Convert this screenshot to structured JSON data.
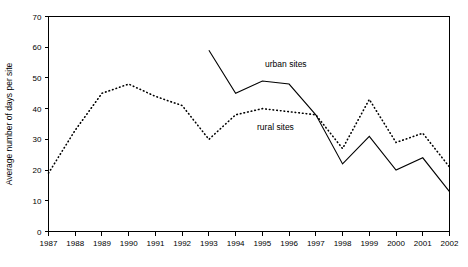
{
  "chart_data": {
    "type": "line",
    "title": "",
    "xlabel": "",
    "ylabel": "Average number of days per site",
    "categories": [
      "1987",
      "1988",
      "1989",
      "1990",
      "1991",
      "1992",
      "1993",
      "1994",
      "1995",
      "1996",
      "1997",
      "1998",
      "1999",
      "2000",
      "2001",
      "2002"
    ],
    "x": [
      1987,
      1988,
      1989,
      1990,
      1991,
      1992,
      1993,
      1994,
      1995,
      1996,
      1997,
      1998,
      1999,
      2000,
      2001,
      2002
    ],
    "xlim": [
      1987,
      2002
    ],
    "ylim": [
      0,
      70
    ],
    "ytick_values": [
      0,
      10,
      20,
      30,
      40,
      50,
      60,
      70
    ],
    "ytick_labels": [
      "0",
      "10",
      "20",
      "30",
      "40",
      "50",
      "60",
      "70"
    ],
    "grid": false,
    "legend": "inline-annotations",
    "series": [
      {
        "name": "urban sites",
        "style": "solid",
        "label": "urban sites",
        "x": [
          1993,
          1994,
          1995,
          1996,
          1997,
          1998,
          1999,
          2000,
          2001,
          2002
        ],
        "values": [
          59,
          45,
          49,
          48,
          38,
          22,
          31,
          20,
          24,
          13
        ]
      },
      {
        "name": "rural sites",
        "style": "dotted",
        "label": "rural sites",
        "x": [
          1987,
          1988,
          1989,
          1990,
          1991,
          1992,
          1993,
          1994,
          1995,
          1996,
          1997,
          1998,
          1999,
          2000,
          2001,
          2002
        ],
        "values": [
          19,
          33,
          45,
          48,
          44,
          41,
          30,
          38,
          40,
          39,
          38,
          27,
          43,
          29,
          32,
          21
        ]
      }
    ],
    "annotations": [
      {
        "text": "urban sites",
        "x": 1995.1,
        "y": 53.5
      },
      {
        "text": "rural sites",
        "x": 1994.8,
        "y": 33.0
      }
    ]
  }
}
